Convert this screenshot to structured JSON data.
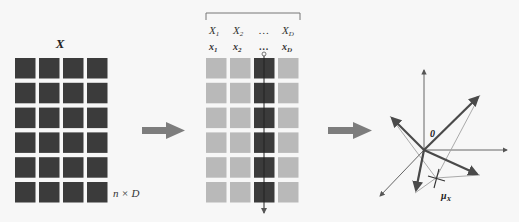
{
  "panel_left": {
    "matrix_label": "X",
    "dims_label": "n × D",
    "rows": 6,
    "cols": 4,
    "cell_color": "#3b3b3b"
  },
  "panel_middle": {
    "variable_labels": [
      "X",
      "X",
      "…",
      "X"
    ],
    "variable_subscripts": [
      "1",
      "2",
      "",
      "D"
    ],
    "vector_labels": [
      "x",
      "x",
      "…",
      "x"
    ],
    "vector_subscripts": [
      "1",
      "2",
      "",
      "D"
    ],
    "rows": 6,
    "cols": 4,
    "highlight_col": 2,
    "cell_color": "#b9b9b9",
    "highlight_color": "#3b3b3b"
  },
  "panel_right": {
    "origin_label": "0",
    "mean_label": "μ",
    "mean_subscript": "X"
  },
  "colors": {
    "arrow": "#7d7d7d",
    "vector": "#4a4a4a",
    "thin_line": "#9a9a9a",
    "axis": "#555555"
  }
}
